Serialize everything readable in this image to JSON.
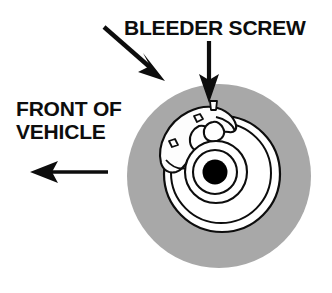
{
  "diagram": {
    "type": "technical-illustration",
    "background_color": "#ffffff",
    "labels": {
      "title": "BLEEDER SCREW",
      "direction_line1": "FRONT OF",
      "direction_line2": "VEHICLE"
    },
    "colors": {
      "tire_gray": "#a8a8a8",
      "rotor_white": "#ffffff",
      "outline_black": "#0d0d0d",
      "hub_black": "#000000",
      "caliper_white": "#fdfdfd"
    },
    "annotations": [
      {
        "name": "caliper-pointer-arrow",
        "label": "FRONT OF VEHICLE",
        "direction": "down-right",
        "points_to": "brake-caliper"
      },
      {
        "name": "bleeder-screw-pointer-arrow",
        "label": "BLEEDER SCREW",
        "direction": "down",
        "points_to": "bleeder-screw"
      },
      {
        "name": "front-of-vehicle-direction-arrow",
        "label": "FRONT OF VEHICLE",
        "direction": "left",
        "points_to": "vehicle-front"
      }
    ],
    "geometry": {
      "tire": {
        "cx": 219,
        "cy": 176,
        "r": 92
      },
      "rotor_outer": {
        "cx": 222,
        "cy": 174,
        "r": 58
      },
      "rotor_inner_ring": {
        "cx": 221,
        "cy": 173,
        "r": 50
      },
      "hub_flange": {
        "cx": 216,
        "cy": 172,
        "r": 31
      },
      "hub_ring": {
        "cx": 215,
        "cy": 172,
        "r": 22
      },
      "hub_center": {
        "cx": 215,
        "cy": 172,
        "r": 12
      }
    },
    "parts": [
      {
        "name": "tire",
        "description": "gray outer tire circle"
      },
      {
        "name": "brake-rotor",
        "description": "white disc rotor"
      },
      {
        "name": "brake-caliper",
        "description": "caliper with two bolt holes at upper left"
      },
      {
        "name": "bleeder-screw",
        "description": "screw at top of caliper"
      },
      {
        "name": "wheel-hub",
        "description": "black center hub"
      }
    ]
  }
}
